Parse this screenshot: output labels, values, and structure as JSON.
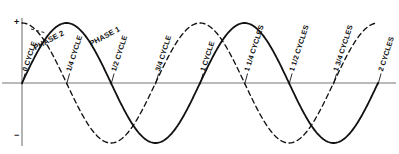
{
  "figure": {
    "background_color": "#ffffff",
    "ink_color": "#111111",
    "axis_color": "#777777"
  },
  "axis": {
    "positive_sign": "+",
    "negative_sign": "−",
    "baseline_name": "zero-line",
    "vertical_axis_name": "amplitude-axis"
  },
  "phase_labels": [
    {
      "text": "PHASE 2",
      "x": 36,
      "y": 44,
      "rotation": -28,
      "series": "phase-2"
    },
    {
      "text": "PHASE 1",
      "x": 92,
      "y": 40,
      "rotation": -28,
      "series": "phase-1"
    }
  ],
  "tick_labels": [
    {
      "text": "0 CYCLE",
      "x": 0.0
    },
    {
      "text": "1/4 CYCLE",
      "x": 0.25
    },
    {
      "text": "1/2 CYCLE",
      "x": 0.5
    },
    {
      "text": "3/4 CYCLE",
      "x": 0.75
    },
    {
      "text": "1 CYCLE",
      "x": 1.0
    },
    {
      "text": "1 1/4 CYCLES",
      "x": 1.25
    },
    {
      "text": "1 1/2 CYCLES",
      "x": 1.5
    },
    {
      "text": "1 3/4 CYCLES",
      "x": 1.75
    },
    {
      "text": "2 CYCLES",
      "x": 2.0
    }
  ],
  "chart_data": {
    "type": "line",
    "title": "",
    "subtitle": "",
    "xlabel": "",
    "ylabel": "",
    "xlim": [
      0,
      2
    ],
    "ylim": [
      -1,
      1
    ],
    "grid": false,
    "legend_position": "inline-annotations",
    "x_tick_labels": [
      "0 CYCLE",
      "1/4 CYCLE",
      "1/2 CYCLE",
      "3/4 CYCLE",
      "1 CYCLE",
      "1 1/4 CYCLES",
      "1 1/2 CYCLES",
      "1 3/4 CYCLES",
      "2 CYCLES"
    ],
    "x_ticks": [
      0,
      0.25,
      0.5,
      0.75,
      1.0,
      1.25,
      1.5,
      1.75,
      2.0
    ],
    "y_tick_labels": [
      "+",
      "−"
    ],
    "annotations": [
      "PHASE 2",
      "PHASE 1"
    ],
    "series": [
      {
        "name": "PHASE 1",
        "style": "solid",
        "color": "#111111",
        "form": "sine",
        "amplitude": 1,
        "cycles": 2,
        "phase_degrees": 0,
        "values_at_ticks": [
          0,
          1,
          0,
          -1,
          0,
          1,
          0,
          -1,
          0
        ]
      },
      {
        "name": "PHASE 2",
        "style": "dashed",
        "color": "#111111",
        "form": "sine",
        "amplitude": 1,
        "cycles": 2,
        "phase_degrees": 90,
        "values_at_ticks": [
          1,
          0,
          -1,
          0,
          1,
          0,
          -1,
          0,
          1
        ]
      }
    ]
  }
}
